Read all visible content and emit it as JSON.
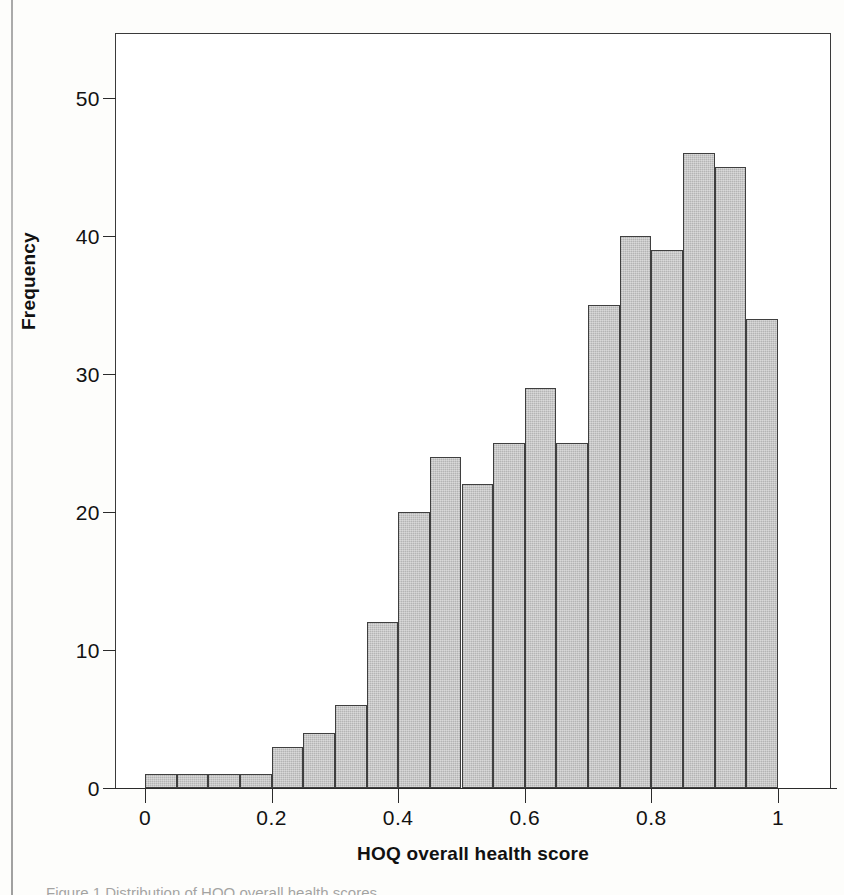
{
  "figure": {
    "caption": "Figure 1  Distribution of HOQ overall health scores"
  },
  "chart_data": {
    "type": "bar",
    "title": "",
    "subtitle": "",
    "xlabel": "HOQ overall health score",
    "ylabel": "Frequency",
    "xlim": [
      -0.05,
      1.08
    ],
    "ylim": [
      0,
      53
    ],
    "grid": false,
    "legend": null,
    "bin_width": 0.05,
    "xticks": [
      "0",
      "0.2",
      "0.4",
      "0.6",
      "0.8",
      "1"
    ],
    "xtick_values": [
      0,
      0.2,
      0.4,
      0.6,
      0.8,
      1
    ],
    "yticks": [
      "0",
      "10",
      "20",
      "30",
      "40",
      "50"
    ],
    "ytick_values": [
      0,
      10,
      20,
      30,
      40,
      50
    ],
    "bin_starts": [
      0.0,
      0.05,
      0.1,
      0.15,
      0.2,
      0.25,
      0.3,
      0.35,
      0.4,
      0.45,
      0.5,
      0.55,
      0.6,
      0.65,
      0.7,
      0.75,
      0.8,
      0.85,
      0.9,
      0.95
    ],
    "categories": [
      "0.00-0.05",
      "0.05-0.10",
      "0.10-0.15",
      "0.15-0.20",
      "0.20-0.25",
      "0.25-0.30",
      "0.30-0.35",
      "0.35-0.40",
      "0.40-0.45",
      "0.45-0.50",
      "0.50-0.55",
      "0.55-0.60",
      "0.60-0.65",
      "0.65-0.70",
      "0.70-0.75",
      "0.75-0.80",
      "0.80-0.85",
      "0.85-0.90",
      "0.90-0.95",
      "0.95-1.00"
    ],
    "values": [
      1,
      1,
      1,
      1,
      3,
      4,
      6,
      12,
      20,
      24,
      22,
      25,
      29,
      25,
      35,
      40,
      39,
      46,
      45,
      34
    ],
    "bars": [
      {
        "bin": "0.00-0.05",
        "value": 1
      },
      {
        "bin": "0.05-0.10",
        "value": 1
      },
      {
        "bin": "0.10-0.15",
        "value": 1
      },
      {
        "bin": "0.15-0.20",
        "value": 1
      },
      {
        "bin": "0.20-0.25",
        "value": 3
      },
      {
        "bin": "0.25-0.30",
        "value": 4
      },
      {
        "bin": "0.30-0.35",
        "value": 6
      },
      {
        "bin": "0.35-0.40",
        "value": 12
      },
      {
        "bin": "0.40-0.45",
        "value": 20
      },
      {
        "bin": "0.45-0.50",
        "value": 24
      },
      {
        "bin": "0.50-0.55",
        "value": 22
      },
      {
        "bin": "0.55-0.60",
        "value": 25
      },
      {
        "bin": "0.60-0.65",
        "value": 29
      },
      {
        "bin": "0.65-0.70",
        "value": 25
      },
      {
        "bin": "0.70-0.75",
        "value": 35
      },
      {
        "bin": "0.75-0.80",
        "value": 40
      },
      {
        "bin": "0.80-0.85",
        "value": 39
      },
      {
        "bin": "0.85-0.90",
        "value": 46
      },
      {
        "bin": "0.90-0.95",
        "value": 45
      },
      {
        "bin": "0.95-1.00",
        "value": 34
      }
    ],
    "bar_fill_color": "#c2c2c2",
    "bar_edge_color": "#3f3f3f",
    "axis_color": "#2b2b2b"
  }
}
